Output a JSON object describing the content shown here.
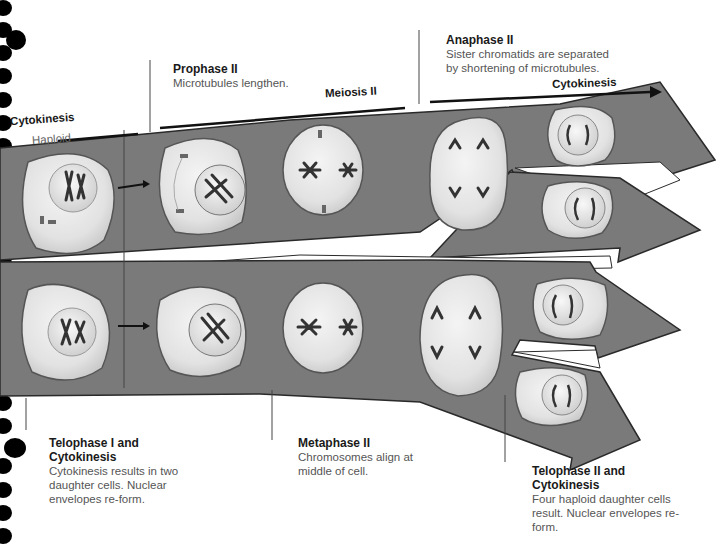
{
  "figure": {
    "title": "Meiosis II",
    "arrow_labels": {
      "haploid": "Haploid",
      "cytokinesis_left": "Cytokinesis",
      "meiosis_ii": "Meiosis II",
      "cytokinesis_right": "Cytokinesis"
    },
    "callouts": [
      {
        "id": "prophase-ii",
        "title": "Prophase II",
        "desc": "Microtubules lengthen."
      },
      {
        "id": "anaphase-ii",
        "title": "Anaphase II",
        "desc": "Sister chromatids are separated by shortening of microtubules."
      },
      {
        "id": "telophase-i",
        "title": "Telophase I and Cytokinesis",
        "desc": "Cytokinesis results in two daughter cells. Nuclear envelopes re-form."
      },
      {
        "id": "metaphase-ii",
        "title": "Metaphase II",
        "desc": "Chromosomes align at middle of cell."
      },
      {
        "id": "telophase-ii",
        "title": "Telophase II and Cytokinesis",
        "desc": "Four haploid daughter cells result. Nuclear envelopes re-form."
      }
    ],
    "colors": {
      "arrow_fill": "#7a7a7a",
      "arrow_stroke": "#2a2a2a",
      "cell_fill": "#e6e6e6",
      "cell_stroke": "#555555",
      "chromosome": "#333333",
      "binder_hole": "#000000"
    }
  }
}
